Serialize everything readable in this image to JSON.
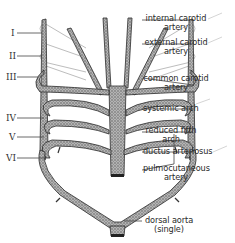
{
  "figure": {
    "arch_numerals": [
      "I",
      "II",
      "III",
      "IV",
      "V",
      "VI"
    ],
    "labels": {
      "internal_carotid_line1": "internal carotid",
      "internal_carotid_line2": "artery",
      "external_carotid_line1": "external carotid",
      "external_carotid_line2": "artery",
      "common_carotid_line1": "common carotid",
      "common_carotid_line2": "artery",
      "systemic_arch": "systemic arch",
      "reduced_fifth_line1": "reduced fifth",
      "reduced_fifth_line2": "arch",
      "ductus_arteriosus": "ductus arteriosus",
      "pulmocutaneous_line1": "pulmocutaneous",
      "pulmocutaneous_line2": "artery",
      "dorsal_aorta_line1": "dorsal aorta",
      "dorsal_aorta_line2": "(single)"
    },
    "colors": {
      "vessel_fill": "#9a9a9a",
      "vessel_outline": "#2b2b2b",
      "leader_line": "#444444",
      "faint_arch": "#b8b8b8"
    }
  }
}
